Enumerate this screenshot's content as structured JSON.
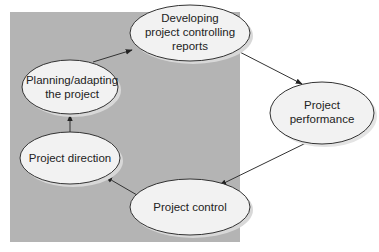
{
  "diagram": {
    "background_panel_color": "#b4b4b4",
    "node_fill": "#f2f2f2",
    "node_stroke": "#333333",
    "nodes": [
      {
        "id": "developing",
        "lines": [
          "Developing",
          "project controlling",
          "reports"
        ]
      },
      {
        "id": "planning",
        "lines": [
          "Planning/adapting",
          "the project"
        ]
      },
      {
        "id": "direction",
        "lines": [
          "Project direction"
        ]
      },
      {
        "id": "control",
        "lines": [
          "Project control"
        ]
      },
      {
        "id": "performance",
        "lines": [
          "Project",
          "performance"
        ]
      }
    ],
    "edges": [
      {
        "from": "planning",
        "to": "developing"
      },
      {
        "from": "developing",
        "to": "performance"
      },
      {
        "from": "performance",
        "to": "control"
      },
      {
        "from": "control",
        "to": "direction"
      },
      {
        "from": "direction",
        "to": "planning"
      }
    ]
  }
}
